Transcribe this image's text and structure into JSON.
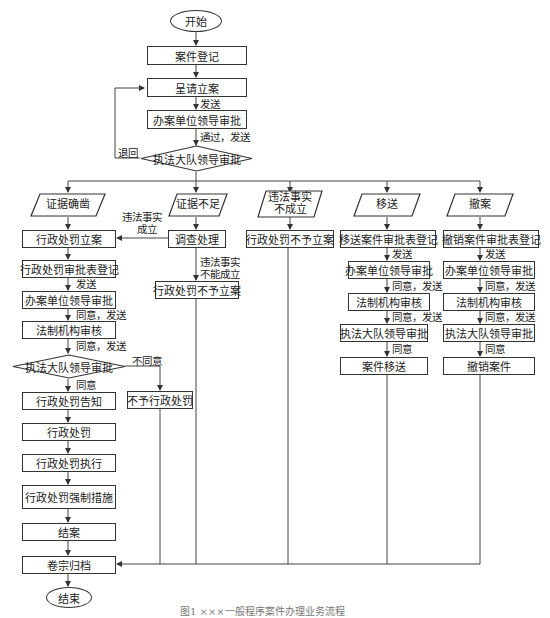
{
  "main_flow": {
    "start": "开始",
    "register": "案件登记",
    "submit": "呈请立案",
    "send_1": "发送",
    "unit_leader": "办案单位领导审批",
    "pass_send": "通过，发送",
    "brigade_leader": "执法大队领导审批",
    "return": "退回"
  },
  "branches": {
    "evidence_solid": {
      "label": "证据确凿",
      "steps": [
        "行政处罚立案",
        "行政处罚审批表登记",
        "办案单位领导审批",
        "法制机构审核",
        "执法大队领导审批",
        "行政处罚告知",
        "行政处罚",
        "行政处罚执行",
        "行政处罚强制措施",
        "结案"
      ],
      "edge_labels": [
        "发送",
        "同意，发送",
        "同意，发送",
        "同意"
      ],
      "disagree_label": "不同意",
      "disagree_result": "不予行政处罚"
    },
    "evidence_insufficient": {
      "label": "证据不足",
      "step": "调查处理",
      "established_label": "违法事实成立",
      "established_line1": "违法事实",
      "established_line2": "成立",
      "not_established_line1": "违法事实",
      "not_established_line2": "不能成立",
      "result": "行政处罚不予立案"
    },
    "facts_not_established": {
      "label_line1": "违法事实",
      "label_line2": "不成立",
      "result": "行政处罚不予立案"
    },
    "transfer": {
      "label": "移送",
      "steps": [
        "移送案件审批表登记",
        "办案单位领导审批",
        "法制机构审核",
        "执法大队领导审批",
        "案件移送"
      ],
      "edge_labels": [
        "发送",
        "同意，发送",
        "同意，发送",
        "同意"
      ]
    },
    "withdraw": {
      "label": "撤案",
      "steps": [
        "撤销案件审批表登记",
        "办案单位领导审批",
        "法制机构审核",
        "执法大队领导审批",
        "撤销案件"
      ],
      "edge_labels": [
        "发送",
        "同意，发送",
        "同意，发送",
        "同意"
      ]
    }
  },
  "archive": "卷宗归档",
  "end": "结束",
  "caption": "图1  ×××一般程序案件办理业务流程"
}
